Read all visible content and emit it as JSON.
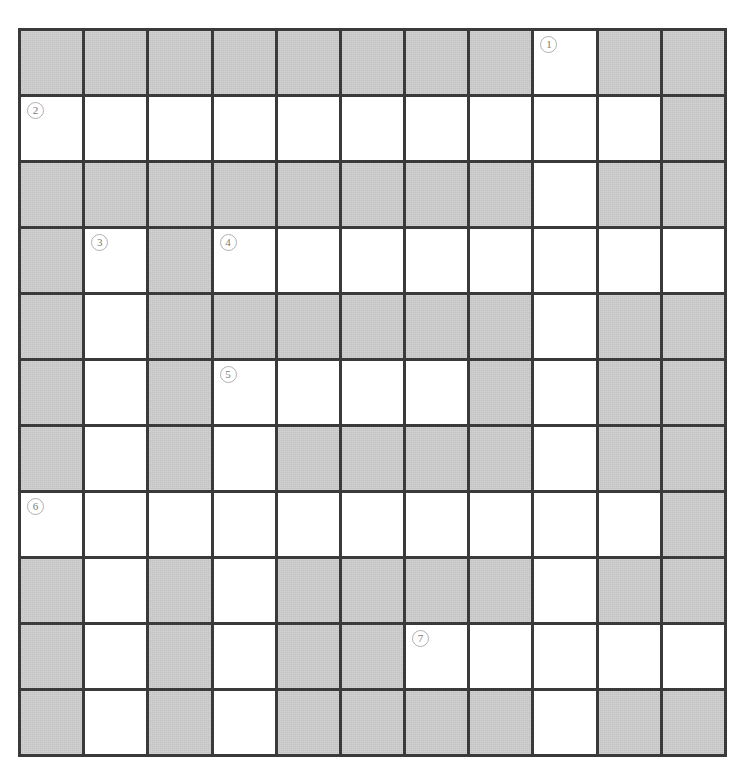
{
  "puzzle": {
    "type": "crossword-grid",
    "rows": 11,
    "columns": 11,
    "colors": {
      "shaded_cell": "#c9c9c9",
      "open_cell": "#ffffff",
      "grid_line": "#3a3a3a",
      "clue_number_text": "#7a7a7a",
      "clue_number_border": "#b0b0b0",
      "page_background": "#ffffff"
    },
    "legend": {
      "open_cell_meaning": "white fillable square",
      "shaded_cell_meaning": "gray blocked square"
    },
    "clue_numbers": [
      "1",
      "2",
      "3",
      "4",
      "5",
      "6",
      "7"
    ],
    "clue_positions": [
      {
        "number": "1",
        "row": 1,
        "column": 9
      },
      {
        "number": "2",
        "row": 2,
        "column": 1
      },
      {
        "number": "3",
        "row": 4,
        "column": 2
      },
      {
        "number": "4",
        "row": 4,
        "column": 4
      },
      {
        "number": "5",
        "row": 6,
        "column": 4
      },
      {
        "number": "6",
        "row": 8,
        "column": 1
      },
      {
        "number": "7",
        "row": 10,
        "column": 7
      }
    ],
    "grid": [
      [
        {
          "state": "shaded",
          "clue": null
        },
        {
          "state": "shaded",
          "clue": null
        },
        {
          "state": "shaded",
          "clue": null
        },
        {
          "state": "shaded",
          "clue": null
        },
        {
          "state": "shaded",
          "clue": null
        },
        {
          "state": "shaded",
          "clue": null
        },
        {
          "state": "shaded",
          "clue": null
        },
        {
          "state": "shaded",
          "clue": null
        },
        {
          "state": "open",
          "clue": "1"
        },
        {
          "state": "shaded",
          "clue": null
        },
        {
          "state": "shaded",
          "clue": null
        }
      ],
      [
        {
          "state": "open",
          "clue": "2"
        },
        {
          "state": "open",
          "clue": null
        },
        {
          "state": "open",
          "clue": null
        },
        {
          "state": "open",
          "clue": null
        },
        {
          "state": "open",
          "clue": null
        },
        {
          "state": "open",
          "clue": null
        },
        {
          "state": "open",
          "clue": null
        },
        {
          "state": "open",
          "clue": null
        },
        {
          "state": "open",
          "clue": null
        },
        {
          "state": "open",
          "clue": null
        },
        {
          "state": "shaded",
          "clue": null
        }
      ],
      [
        {
          "state": "shaded",
          "clue": null
        },
        {
          "state": "shaded",
          "clue": null
        },
        {
          "state": "shaded",
          "clue": null
        },
        {
          "state": "shaded",
          "clue": null
        },
        {
          "state": "shaded",
          "clue": null
        },
        {
          "state": "shaded",
          "clue": null
        },
        {
          "state": "shaded",
          "clue": null
        },
        {
          "state": "shaded",
          "clue": null
        },
        {
          "state": "open",
          "clue": null
        },
        {
          "state": "shaded",
          "clue": null
        },
        {
          "state": "shaded",
          "clue": null
        }
      ],
      [
        {
          "state": "shaded",
          "clue": null
        },
        {
          "state": "open",
          "clue": "3"
        },
        {
          "state": "shaded",
          "clue": null
        },
        {
          "state": "open",
          "clue": "4"
        },
        {
          "state": "open",
          "clue": null
        },
        {
          "state": "open",
          "clue": null
        },
        {
          "state": "open",
          "clue": null
        },
        {
          "state": "open",
          "clue": null
        },
        {
          "state": "open",
          "clue": null
        },
        {
          "state": "open",
          "clue": null
        },
        {
          "state": "open",
          "clue": null
        }
      ],
      [
        {
          "state": "shaded",
          "clue": null
        },
        {
          "state": "open",
          "clue": null
        },
        {
          "state": "shaded",
          "clue": null
        },
        {
          "state": "shaded",
          "clue": null
        },
        {
          "state": "shaded",
          "clue": null
        },
        {
          "state": "shaded",
          "clue": null
        },
        {
          "state": "shaded",
          "clue": null
        },
        {
          "state": "shaded",
          "clue": null
        },
        {
          "state": "open",
          "clue": null
        },
        {
          "state": "shaded",
          "clue": null
        },
        {
          "state": "shaded",
          "clue": null
        }
      ],
      [
        {
          "state": "shaded",
          "clue": null
        },
        {
          "state": "open",
          "clue": null
        },
        {
          "state": "shaded",
          "clue": null
        },
        {
          "state": "open",
          "clue": "5"
        },
        {
          "state": "open",
          "clue": null
        },
        {
          "state": "open",
          "clue": null
        },
        {
          "state": "open",
          "clue": null
        },
        {
          "state": "shaded",
          "clue": null
        },
        {
          "state": "open",
          "clue": null
        },
        {
          "state": "shaded",
          "clue": null
        },
        {
          "state": "shaded",
          "clue": null
        }
      ],
      [
        {
          "state": "shaded",
          "clue": null
        },
        {
          "state": "open",
          "clue": null
        },
        {
          "state": "shaded",
          "clue": null
        },
        {
          "state": "open",
          "clue": null
        },
        {
          "state": "shaded",
          "clue": null
        },
        {
          "state": "shaded",
          "clue": null
        },
        {
          "state": "shaded",
          "clue": null
        },
        {
          "state": "shaded",
          "clue": null
        },
        {
          "state": "open",
          "clue": null
        },
        {
          "state": "shaded",
          "clue": null
        },
        {
          "state": "shaded",
          "clue": null
        }
      ],
      [
        {
          "state": "open",
          "clue": "6"
        },
        {
          "state": "open",
          "clue": null
        },
        {
          "state": "open",
          "clue": null
        },
        {
          "state": "open",
          "clue": null
        },
        {
          "state": "open",
          "clue": null
        },
        {
          "state": "open",
          "clue": null
        },
        {
          "state": "open",
          "clue": null
        },
        {
          "state": "open",
          "clue": null
        },
        {
          "state": "open",
          "clue": null
        },
        {
          "state": "open",
          "clue": null
        },
        {
          "state": "shaded",
          "clue": null
        }
      ],
      [
        {
          "state": "shaded",
          "clue": null
        },
        {
          "state": "open",
          "clue": null
        },
        {
          "state": "shaded",
          "clue": null
        },
        {
          "state": "open",
          "clue": null
        },
        {
          "state": "shaded",
          "clue": null
        },
        {
          "state": "shaded",
          "clue": null
        },
        {
          "state": "shaded",
          "clue": null
        },
        {
          "state": "shaded",
          "clue": null
        },
        {
          "state": "open",
          "clue": null
        },
        {
          "state": "shaded",
          "clue": null
        },
        {
          "state": "shaded",
          "clue": null
        }
      ],
      [
        {
          "state": "shaded",
          "clue": null
        },
        {
          "state": "open",
          "clue": null
        },
        {
          "state": "shaded",
          "clue": null
        },
        {
          "state": "open",
          "clue": null
        },
        {
          "state": "shaded",
          "clue": null
        },
        {
          "state": "shaded",
          "clue": null
        },
        {
          "state": "open",
          "clue": "7"
        },
        {
          "state": "open",
          "clue": null
        },
        {
          "state": "open",
          "clue": null
        },
        {
          "state": "open",
          "clue": null
        },
        {
          "state": "open",
          "clue": null
        }
      ],
      [
        {
          "state": "shaded",
          "clue": null
        },
        {
          "state": "open",
          "clue": null
        },
        {
          "state": "shaded",
          "clue": null
        },
        {
          "state": "open",
          "clue": null
        },
        {
          "state": "shaded",
          "clue": null
        },
        {
          "state": "shaded",
          "clue": null
        },
        {
          "state": "shaded",
          "clue": null
        },
        {
          "state": "shaded",
          "clue": null
        },
        {
          "state": "open",
          "clue": null
        },
        {
          "state": "shaded",
          "clue": null
        },
        {
          "state": "shaded",
          "clue": null
        }
      ]
    ]
  }
}
